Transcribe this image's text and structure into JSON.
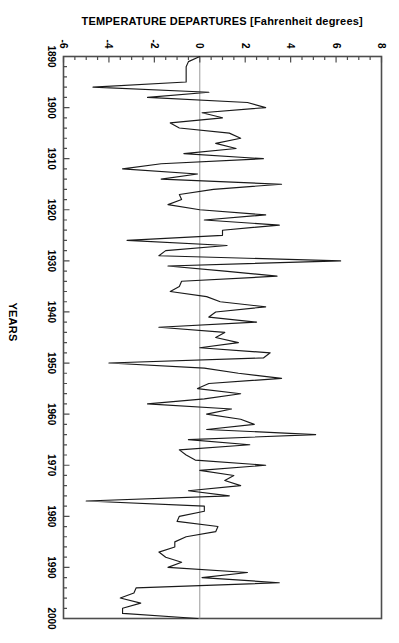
{
  "chart": {
    "type": "line",
    "orientation_note": "rotated-90-clockwise",
    "x_axis_title": "YEARS",
    "y_axis_title": "TEMPERATURE DEPARTURES [Fahrenheit degrees]",
    "x_ticks": [
      "1890",
      "1900",
      "1910",
      "1920",
      "1930",
      "1940",
      "1950",
      "1960",
      "1970",
      "1980",
      "1990",
      "2000"
    ],
    "y_ticks": [
      "8",
      "6",
      "4",
      "2",
      "0",
      "-2",
      "-4",
      "-6"
    ],
    "line_color": "#1a1a1a",
    "axis_color": "#4d4d4d",
    "zero_line_color": "#8c8c8c",
    "background_color": "#ffffff"
  },
  "chart_data": {
    "type": "line",
    "title": "",
    "subtitle": "",
    "xlabel": "YEARS",
    "ylabel": "TEMPERATURE DEPARTURES [Fahrenheit degrees]",
    "xlim": [
      1890,
      2000
    ],
    "ylim": [
      -6,
      8
    ],
    "xticks": [
      1890,
      1900,
      1910,
      1920,
      1930,
      1940,
      1950,
      1960,
      1970,
      1980,
      1990,
      2000
    ],
    "yticks": [
      -6,
      -4,
      -2,
      0,
      2,
      4,
      6,
      8
    ],
    "grid": false,
    "legend": null,
    "zero_reference_line": 0,
    "series": [
      {
        "name": "Temperature departures",
        "x": [
          1890,
          1891,
          1892,
          1893,
          1894,
          1895,
          1896,
          1897,
          1898,
          1899,
          1900,
          1901,
          1902,
          1903,
          1904,
          1905,
          1906,
          1907,
          1908,
          1909,
          1910,
          1911,
          1912,
          1913,
          1914,
          1915,
          1916,
          1917,
          1918,
          1919,
          1920,
          1921,
          1922,
          1923,
          1924,
          1925,
          1926,
          1927,
          1928,
          1929,
          1930,
          1931,
          1932,
          1933,
          1934,
          1935,
          1936,
          1937,
          1938,
          1939,
          1940,
          1941,
          1942,
          1943,
          1944,
          1945,
          1946,
          1947,
          1948,
          1949,
          1950,
          1951,
          1952,
          1953,
          1954,
          1955,
          1956,
          1957,
          1958,
          1959,
          1960,
          1961,
          1962,
          1963,
          1964,
          1965,
          1966,
          1967,
          1968,
          1969,
          1970,
          1971,
          1972,
          1973,
          1974,
          1975,
          1976,
          1977,
          1978,
          1979,
          1980,
          1981,
          1982,
          1983,
          1984,
          1985,
          1986,
          1987,
          1988,
          1989,
          1990,
          1991,
          1992,
          1993,
          1994,
          1995,
          1996,
          1997,
          1998,
          1999,
          2000
        ],
        "values": [
          0.0,
          -0.5,
          -0.6,
          -0.6,
          -0.6,
          -0.6,
          -4.7,
          0.4,
          -2.3,
          2.1,
          2.9,
          0.1,
          1.0,
          -1.3,
          -0.9,
          1.3,
          1.8,
          0.7,
          1.6,
          -0.7,
          2.8,
          -1.7,
          -3.4,
          -0.1,
          -1.7,
          3.6,
          0.6,
          -0.9,
          -0.8,
          -1.4,
          0.0,
          2.9,
          0.2,
          3.5,
          1.0,
          1.0,
          -3.2,
          1.2,
          -1.5,
          -1.8,
          6.2,
          -1.4,
          1.1,
          3.4,
          -0.8,
          -0.9,
          -1.3,
          0.3,
          0.9,
          2.9,
          0.7,
          0.4,
          2.5,
          -1.8,
          1.1,
          0.7,
          1.7,
          0.0,
          3.1,
          2.8,
          -4.0,
          0.2,
          1.7,
          3.6,
          0.4,
          -0.1,
          1.8,
          0.2,
          -2.3,
          1.4,
          0.3,
          1.8,
          2.4,
          0.3,
          5.1,
          -0.5,
          2.2,
          -0.9,
          -0.6,
          -0.2,
          2.9,
          0.0,
          1.5,
          1.1,
          1.8,
          -0.5,
          1.3,
          -5.0,
          0.2,
          0.2,
          -0.9,
          -1.0,
          0.8,
          0.7,
          -0.6,
          -1.1,
          -1.1,
          -1.8,
          -1.5,
          -0.8,
          -1.4,
          2.1,
          0.1,
          3.5,
          -2.8,
          -2.9,
          -3.5,
          -2.6,
          -3.4,
          -3.4,
          -0.1
        ]
      }
    ]
  }
}
